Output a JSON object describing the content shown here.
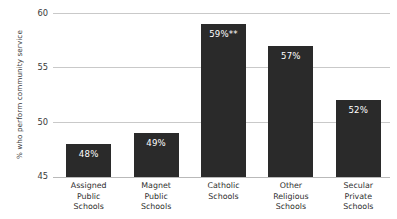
{
  "chart_data": {
    "type": "bar",
    "title": "",
    "xlabel": "",
    "ylabel": "% who perform community service",
    "ylim": [
      45,
      60
    ],
    "yticks": [
      45,
      50,
      55,
      60
    ],
    "grid": true,
    "legend": false,
    "categories": [
      "Assigned Public Schools",
      "Magnet Public Schools",
      "Catholic Schools",
      "Other Religious Schools",
      "Secular Private Schools"
    ],
    "category_lines": [
      [
        "Assigned",
        "Public",
        "Schools"
      ],
      [
        "Magnet",
        "Public",
        "Schools"
      ],
      [
        "Catholic",
        "Schools"
      ],
      [
        "Other",
        "Religious",
        "Schools"
      ],
      [
        "Secular",
        "Private",
        "Schools"
      ]
    ],
    "values": [
      48,
      49,
      59,
      57,
      52
    ],
    "data_labels": [
      "48%",
      "49%",
      "59%**",
      "57%",
      "52%"
    ],
    "annotations": [
      "** denotes significance marker on Catholic Schools"
    ],
    "bar_color": "#2a2a2a",
    "label_color": "#ffffff",
    "grid_color": "#c9c9c9",
    "axis_text_color": "#3a3a3a"
  },
  "axis": {
    "ytick_labels": [
      "60",
      "55",
      "50",
      "45"
    ],
    "ytitle": "% who perform community service"
  }
}
